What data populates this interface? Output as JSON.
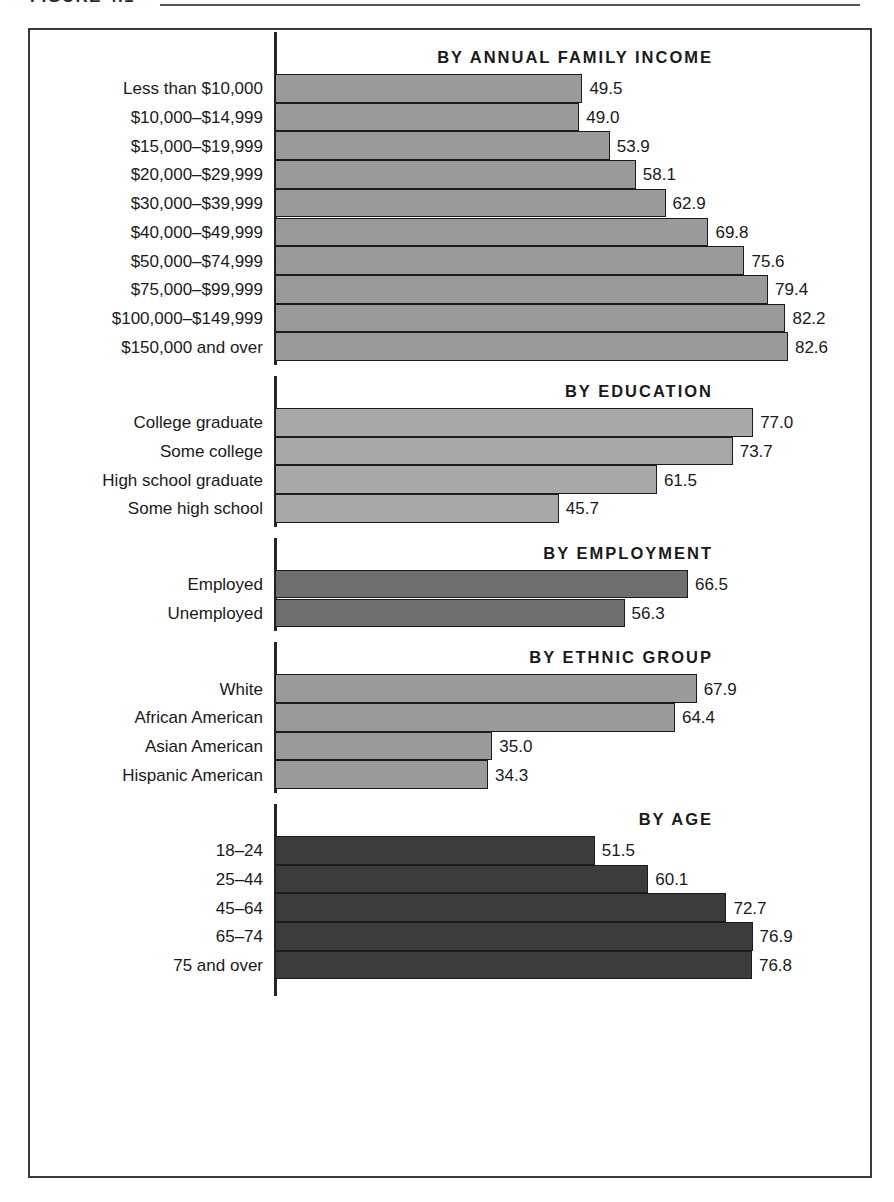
{
  "figure": {
    "caption": "FIGURE 4.1",
    "rule_visible": true
  },
  "axis": {
    "baseline_label": "0",
    "max_value": 100,
    "px_per_unit": 6.21
  },
  "colors": {
    "income_bar": "#9a9a9a",
    "education_bar": "#a8a8a8",
    "employment_bar": "#6e6e6e",
    "ethnic_bar": "#9a9a9a",
    "age_bar": "#3c3c3c",
    "bar_outline": "#1c1c1c",
    "frame": "#3a3a3a",
    "text": "#1a1a1a"
  },
  "chart_data": {
    "type": "bar",
    "orientation": "horizontal",
    "title": "",
    "xlabel": "",
    "ylabel": "",
    "xlim": [
      0,
      100
    ],
    "grid": false,
    "legend": "none",
    "panels": [
      {
        "id": "income",
        "header": "BY ANNUAL FAMILY INCOME",
        "color": "#9a9a9a",
        "categories": [
          "Less than $10,000",
          "$10,000–$14,999",
          "$15,000–$19,999",
          "$20,000–$29,999",
          "$30,000–$39,999",
          "$40,000–$49,999",
          "$50,000–$74,999",
          "$75,000–$99,999",
          "$100,000–$149,999",
          "$150,000 and over"
        ],
        "values": [
          49.5,
          49.0,
          53.9,
          58.1,
          62.9,
          69.8,
          75.6,
          79.4,
          82.2,
          82.6
        ],
        "labels": [
          "49.5",
          "49.0",
          "53.9",
          "58.1",
          "62.9",
          "69.8",
          "75.6",
          "79.4",
          "82.2",
          "82.6"
        ]
      },
      {
        "id": "education",
        "header": "BY EDUCATION",
        "color": "#a8a8a8",
        "categories": [
          "College graduate",
          "Some college",
          "High school graduate",
          "Some high school"
        ],
        "values": [
          77.0,
          73.7,
          61.5,
          45.7
        ],
        "labels": [
          "77.0",
          "73.7",
          "61.5",
          "45.7"
        ]
      },
      {
        "id": "employment",
        "header": "BY EMPLOYMENT",
        "color": "#6e6e6e",
        "categories": [
          "Employed",
          "Unemployed"
        ],
        "values": [
          66.5,
          56.3
        ],
        "labels": [
          "66.5",
          "56.3"
        ]
      },
      {
        "id": "ethnic",
        "header": "BY ETHNIC GROUP",
        "color": "#9a9a9a",
        "categories": [
          "White",
          "African American",
          "Asian American",
          "Hispanic American"
        ],
        "values": [
          67.9,
          64.4,
          35.0,
          34.3
        ],
        "labels": [
          "67.9",
          "64.4",
          "35.0",
          "34.3"
        ]
      },
      {
        "id": "age",
        "header": "BY AGE",
        "color": "#3c3c3c",
        "categories": [
          "18–24",
          "25–44",
          "45–64",
          "65–74",
          "75 and over"
        ],
        "values": [
          51.5,
          60.1,
          72.7,
          76.9,
          76.8
        ],
        "labels": [
          "51.5",
          "60.1",
          "72.7",
          "76.9",
          "76.8"
        ]
      }
    ]
  }
}
